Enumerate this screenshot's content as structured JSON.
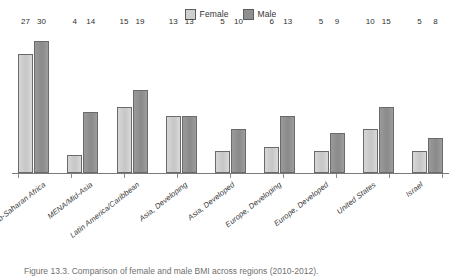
{
  "chart_data": {
    "type": "bar",
    "title": "",
    "xlabel": "",
    "ylabel": "",
    "ylim": [
      0,
      33
    ],
    "grid": false,
    "legend_position": "top-center",
    "categories": [
      "Sub-Saharan Africa",
      "MENA/Mid-Asia",
      "Latin America/Caribbean",
      "Asia, Developing",
      "Asia, Developed",
      "Europe, Developing",
      "Europe, Developed",
      "United States",
      "Israel"
    ],
    "series": [
      {
        "name": "Female",
        "color": "#cfcfcf",
        "values": [
          27,
          4,
          15,
          13,
          5,
          6,
          5,
          10,
          5
        ]
      },
      {
        "name": "Male",
        "color": "#8f8f8f",
        "values": [
          30,
          14,
          19,
          13,
          10,
          13,
          9,
          15,
          8
        ]
      }
    ]
  },
  "legend": {
    "entries": [
      {
        "label": "Female",
        "swatch": "female"
      },
      {
        "label": "Male",
        "swatch": "male"
      }
    ]
  },
  "caption": {
    "text": "Figure 13.3. Comparison of female and male BMI across regions (2010-2012)."
  }
}
